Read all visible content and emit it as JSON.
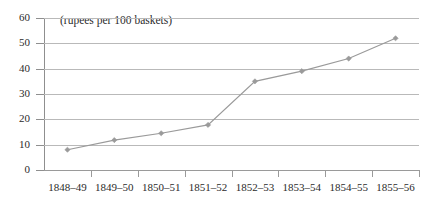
{
  "chart_data": {
    "type": "line",
    "title": "",
    "annotation": "(rupees per 100 baskets)",
    "xlabel": "",
    "ylabel": "",
    "categories": [
      "1848–49",
      "1849–50",
      "1850–51",
      "1851–52",
      "1852–53",
      "1853–54",
      "1854–55",
      "1855–56"
    ],
    "values": [
      8,
      11.8,
      14.5,
      17.8,
      35,
      39,
      44,
      52
    ],
    "ylim": [
      0,
      60
    ],
    "yticks": [
      0,
      10,
      20,
      30,
      40,
      50,
      60
    ],
    "ytick_labels": [
      "0",
      "10",
      "20",
      "30",
      "40",
      "50",
      "60"
    ],
    "grid": true,
    "legend": "none",
    "series_color": "#9a9a9a",
    "marker": "diamond",
    "grid_color": "#b9b9b9",
    "axis_color": "#8f8f8f"
  }
}
